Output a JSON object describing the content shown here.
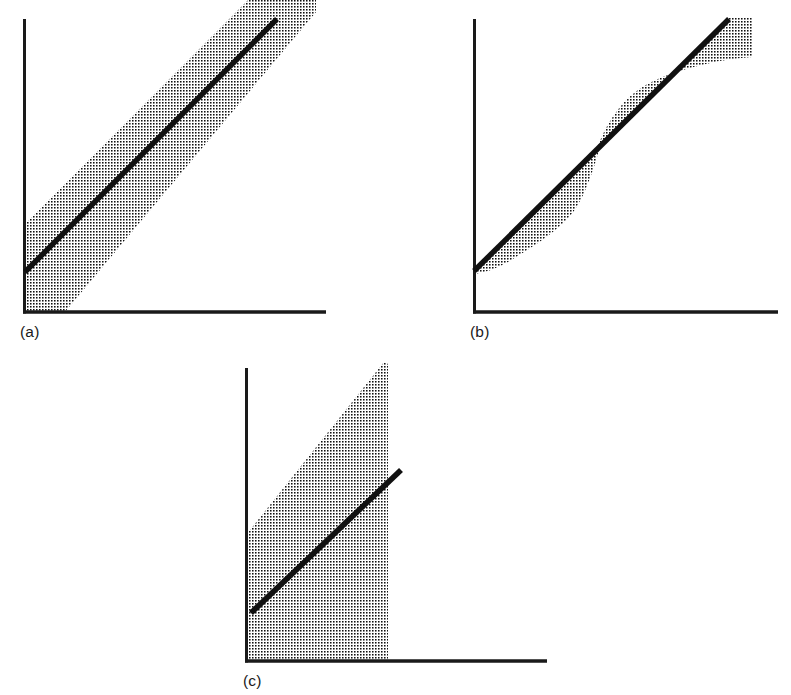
{
  "figure": {
    "title": "",
    "background_color": "#ffffff",
    "ink_color": "#1a1a1a",
    "band_fill": "dotted-halftone-screen",
    "width": 791,
    "height": 695
  },
  "panels": [
    {
      "id": "a",
      "label": "(a)",
      "description": "constant-width band parallel to the fitted line",
      "axes": {
        "origin": [
          24,
          313
        ],
        "y_axis_top": [
          24,
          19
        ],
        "x_axis_right": [
          326,
          313
        ]
      },
      "line": {
        "start": [
          25,
          271
        ],
        "end": [
          276,
          19
        ],
        "stroke_width": 5
      },
      "band": {
        "type": "parallel",
        "upper_offset": 46,
        "lower_offset": 46,
        "clipped_at_top": true
      }
    },
    {
      "id": "b",
      "label": "(b)",
      "description": "lens shaped band, narrow at the ends and bulging on opposite sides of the line at the middle",
      "axes": {
        "origin": [
          474,
          313
        ],
        "y_axis_top": [
          474,
          19
        ],
        "x_axis_right": [
          778,
          313
        ]
      },
      "line": {
        "start": [
          474,
          270
        ],
        "end": [
          728,
          19
        ],
        "stroke_width": 5
      },
      "band": {
        "type": "sigmoid-lobes",
        "lower_lobe_max_offset": 52,
        "upper_lobe_max_offset": 52,
        "crossover_point": [
          597,
          155
        ]
      }
    },
    {
      "id": "c",
      "label": "(c)",
      "description": "wide fan shaped band widening away from the line, truncated on the right",
      "axes": {
        "origin": [
          246,
          662
        ],
        "y_axis_top": [
          246,
          368
        ],
        "x_axis_right": [
          547,
          662
        ]
      },
      "line": {
        "start": [
          252,
          612
        ],
        "end": [
          400,
          470
        ],
        "stroke_width": 5
      },
      "band": {
        "type": "fan",
        "apex": [
          384,
          362
        ],
        "left_edge_on_y_axis": [
          246,
          535
        ],
        "right_edge_x": 388,
        "bottom_on_x_axis_from": 248,
        "bottom_on_x_axis_to": 388
      }
    }
  ],
  "labels": {
    "a": "(a)",
    "b": "(b)",
    "c": "(c)"
  },
  "colors": {
    "ink": "#1a1a1a",
    "dot": "#111111",
    "paper": "#ffffff"
  }
}
